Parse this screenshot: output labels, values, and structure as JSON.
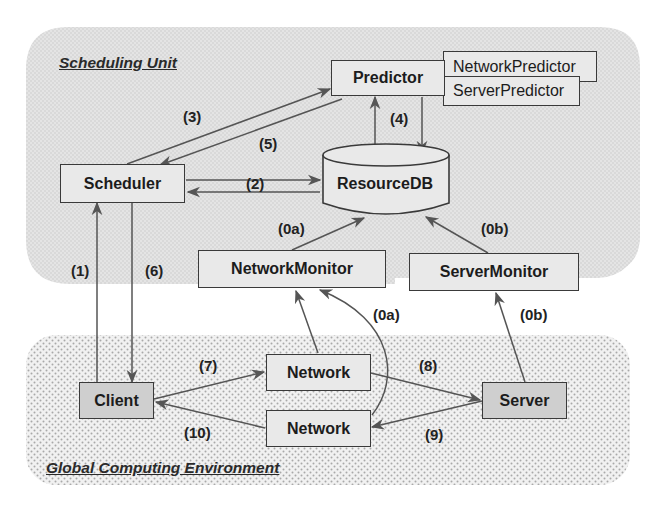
{
  "diagram": {
    "colors": {
      "scheduling_unit_bg": "#d6d6d6",
      "global_env_bg": "#e6e6e6",
      "box_fill": "#e9e9e9",
      "box_fill_dark": "#cfcfcf",
      "line": "#555555"
    },
    "regions": {
      "scheduling_unit": "Scheduling Unit",
      "global_env": "Global Computing Environment"
    },
    "nodes": {
      "predictor": "Predictor",
      "network_predictor": "NetworkPredictor",
      "server_predictor": "ServerPredictor",
      "scheduler": "Scheduler",
      "resource_db": "ResourceDB",
      "network_monitor": "NetworkMonitor",
      "server_monitor": "ServerMonitor",
      "client": "Client",
      "network_top": "Network",
      "network_bottom": "Network",
      "server": "Server"
    },
    "edge_labels": {
      "e1": "(1)",
      "e2": "(2)",
      "e3": "(3)",
      "e4": "(4)",
      "e5": "(5)",
      "e6": "(6)",
      "e7": "(7)",
      "e8": "(8)",
      "e9": "(9)",
      "e10": "(10)",
      "e0a_upper": "(0a)",
      "e0a_lower": "(0a)",
      "e0b_upper": "(0b)",
      "e0b_lower": "(0b)"
    },
    "edges": [
      {
        "from": "Client",
        "to": "Scheduler",
        "label": "(1)"
      },
      {
        "from": "Scheduler",
        "to": "ResourceDB",
        "label": "(2)",
        "bidirectional": true
      },
      {
        "from": "Scheduler",
        "to": "Predictor",
        "label": "(3)"
      },
      {
        "from": "Predictor",
        "to": "ResourceDB",
        "label": "(4)",
        "bidirectional": true
      },
      {
        "from": "Predictor",
        "to": "Scheduler",
        "label": "(5)"
      },
      {
        "from": "Scheduler",
        "to": "Client",
        "label": "(6)"
      },
      {
        "from": "Client",
        "to": "Network",
        "label": "(7)"
      },
      {
        "from": "Network",
        "to": "Server",
        "label": "(8)"
      },
      {
        "from": "Server",
        "to": "Network",
        "label": "(9)"
      },
      {
        "from": "Network",
        "to": "Client",
        "label": "(10)"
      },
      {
        "from": "NetworkMonitor",
        "to": "ResourceDB",
        "label": "(0a)"
      },
      {
        "from": "Network",
        "to": "NetworkMonitor",
        "label": "(0a)"
      },
      {
        "from": "ServerMonitor",
        "to": "ResourceDB",
        "label": "(0b)"
      },
      {
        "from": "Server",
        "to": "ServerMonitor",
        "label": "(0b)"
      }
    ]
  }
}
